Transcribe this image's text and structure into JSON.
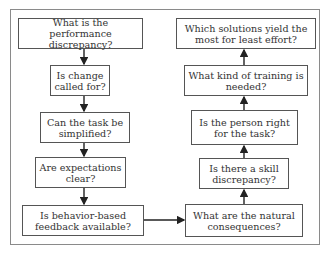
{
  "diagram": {
    "type": "flowchart",
    "left_column": [
      {
        "id": "n1",
        "label": "What is the performance discrepancy?"
      },
      {
        "id": "n2",
        "label": "Is change called for?"
      },
      {
        "id": "n3",
        "label": "Can the task be simplified?"
      },
      {
        "id": "n4",
        "label": "Are expectations clear?"
      },
      {
        "id": "n5",
        "label": "Is behavior-based feedback available?"
      }
    ],
    "right_column": [
      {
        "id": "n6",
        "label": "What are the natural consequences?"
      },
      {
        "id": "n7",
        "label": "Is there a skill discrepancy?"
      },
      {
        "id": "n8",
        "label": "Is the person right for the task?"
      },
      {
        "id": "n9",
        "label": "What kind of training is needed?"
      },
      {
        "id": "n10",
        "label": "Which solutions yield the most for least effort?"
      }
    ],
    "edges": [
      [
        "n1",
        "n2"
      ],
      [
        "n2",
        "n3"
      ],
      [
        "n3",
        "n4"
      ],
      [
        "n4",
        "n5"
      ],
      [
        "n5",
        "n6"
      ],
      [
        "n6",
        "n7"
      ],
      [
        "n7",
        "n8"
      ],
      [
        "n8",
        "n9"
      ],
      [
        "n9",
        "n10"
      ]
    ]
  }
}
